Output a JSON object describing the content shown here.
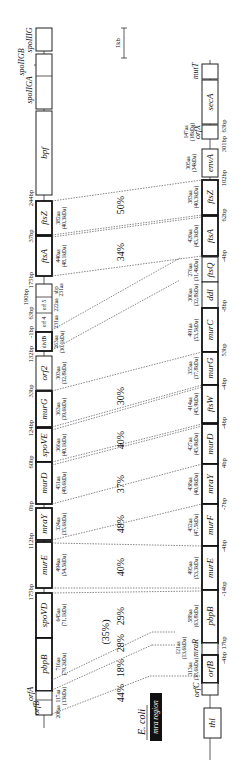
{
  "scale_bar": {
    "label": "1kb"
  },
  "region_label": {
    "species": "E. coli",
    "region": "mra region"
  },
  "b_subtilis": {
    "genes": [
      {
        "name": "spoIIIG",
        "label": "spoIIIG"
      },
      {
        "name": "spoIIGB",
        "label": "spoIIGB"
      },
      {
        "name": "spoIIGA",
        "label": "spoIIGA"
      },
      {
        "name": "bpf",
        "label": "bpf"
      },
      {
        "name": "ftsZ",
        "label": "ftsZ",
        "aa": "382aa",
        "kda": "(40,3kDa)"
      },
      {
        "name": "ftsA",
        "label": "ftsA",
        "aa": "440aa",
        "kda": "(48,1kDa)"
      },
      {
        "name": "sbp",
        "label": "sbp",
        "aa": "231aa"
      },
      {
        "name": "orf5",
        "label": "orf 5",
        "aa": "222aa"
      },
      {
        "name": "orf4",
        "label": "orf 4",
        "aa": "231aa"
      },
      {
        "name": "divIB",
        "label": "divIB",
        "aa": "263aa",
        "kda": "(30,1kDa)"
      },
      {
        "name": "orf2",
        "label": "orf2",
        "aa": "303aa",
        "kda": "(32,8kDa)"
      },
      {
        "name": "murG",
        "label": "murG",
        "aa": "363aa",
        "kda": "(39,6kDa)"
      },
      {
        "name": "spoVE",
        "label": "spoVE",
        "aa": "366aa",
        "kda": "(40,1kDa)"
      },
      {
        "name": "murD",
        "label": "murD",
        "aa": "451aa",
        "kda": "(49,6kDa)"
      },
      {
        "name": "mraY",
        "label": "mraY",
        "aa": "324aa",
        "kda": "(35,6kDa)"
      },
      {
        "name": "murE",
        "label": "murE",
        "aa": "494aa",
        "kda": "(54,5kDa)"
      },
      {
        "name": "spoVD",
        "label": "spoVD",
        "aa": "645aa",
        "kda": "(71,1kDa)"
      },
      {
        "name": "pbpB",
        "label": "pbpB",
        "aa": "716aa",
        "kda": "(79,2kDa)"
      },
      {
        "name": "orfA",
        "label": "orfA",
        "aa": "117aa",
        "kda": "(13kDa)"
      },
      {
        "name": "orfB",
        "label": "orfB",
        "aa": "208aa"
      }
    ],
    "spacers": [
      "244bp",
      "37bp",
      "175bp",
      "190bp",
      "63bp",
      "-1bp",
      "132bp",
      "33bp",
      "124bp",
      "60bp",
      "0bp",
      "112bp",
      "175bp"
    ]
  },
  "e_coli": {
    "genes": [
      {
        "name": "mutT",
        "label": "mutT"
      },
      {
        "name": "secA",
        "label": "secA"
      },
      {
        "name": "orfX",
        "label": "orfX",
        "aa": "147aa",
        "kda": "(18kDa)"
      },
      {
        "name": "envA",
        "label": "envA",
        "aa": "305aa",
        "kda": "(34kDa)"
      },
      {
        "name": "ftsZ",
        "label": "ftsZ",
        "aa": "383aa",
        "kda": "(40,3kDa)"
      },
      {
        "name": "ftsA",
        "label": "ftsA",
        "aa": "420aa",
        "kda": "(45,3kDa)"
      },
      {
        "name": "ftsQ",
        "label": "ftsQ",
        "aa": "276aa",
        "kda": "(31,4kDa)"
      },
      {
        "name": "ddl",
        "label": "ddl",
        "aa": "306aa",
        "kda": "(32,8kDa)"
      },
      {
        "name": "murC",
        "label": "murC",
        "aa": "491aa",
        "kda": "(53,5kDa)"
      },
      {
        "name": "murG",
        "label": "murG",
        "aa": "355aa",
        "kda": "(37,8kDa)"
      },
      {
        "name": "ftsW",
        "label": "ftsW",
        "aa": "414aa",
        "kda": "(45,9kDa)"
      },
      {
        "name": "murD",
        "label": "murD",
        "aa": "427aa",
        "kda": "(45,0kDa)"
      },
      {
        "name": "mraY",
        "label": "mraY",
        "aa": "438aa",
        "kda": "(40,0kDa)"
      },
      {
        "name": "murF",
        "label": "murF",
        "aa": "452aa",
        "kda": "(47,5kDa)"
      },
      {
        "name": "murE",
        "label": "murE",
        "aa": "495aa",
        "kda": "(53,3kDa)"
      },
      {
        "name": "pbpB",
        "label": "pbpB",
        "aa": "588aa",
        "kda": "(63,8kDa)"
      },
      {
        "name": "mraR",
        "label": "mraR",
        "aa": "121aa",
        "kda": "(13,6kDa)"
      },
      {
        "name": "orfB",
        "label": "orfB",
        "aa": "313aa",
        "kda": "(38,6kDa)"
      },
      {
        "name": "orfC",
        "label": "orfC"
      },
      {
        "name": "thl",
        "label": "thl"
      }
    ],
    "spacers": [
      "63bp",
      "301bp",
      "102bp",
      "62bp",
      "-4bp",
      "-8bp",
      "53bp",
      "-4bp",
      "-4bp",
      "4bp",
      "-7bp",
      "-4bp",
      "-14bp",
      "17bp",
      "-4bp"
    ]
  },
  "identities": [
    "50%",
    "34%",
    "30%",
    "40%",
    "37%",
    "48%",
    "40%",
    "29%",
    "28%",
    "18%",
    "44%",
    "(35%)"
  ]
}
